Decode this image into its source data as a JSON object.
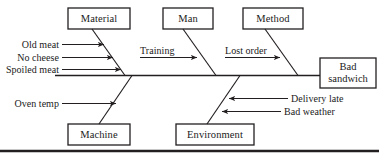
{
  "diagram": {
    "type": "fishbone-ishikawa",
    "effect": {
      "label_line1": "Bad",
      "label_line2": "sandwich"
    },
    "categories": [
      {
        "id": "material",
        "label": "Material",
        "position": "top",
        "causes": [
          {
            "label": "Old meat",
            "arrow": "right"
          },
          {
            "label": "No cheese",
            "arrow": "right"
          },
          {
            "label": "Spoiled meat",
            "arrow": "right"
          }
        ]
      },
      {
        "id": "man",
        "label": "Man",
        "position": "top",
        "causes": [
          {
            "label": "Training",
            "arrow": "right"
          }
        ]
      },
      {
        "id": "method",
        "label": "Method",
        "position": "top",
        "causes": [
          {
            "label": "Lost order",
            "arrow": "right"
          }
        ]
      },
      {
        "id": "machine",
        "label": "Machine",
        "position": "bottom",
        "causes": [
          {
            "label": "Oven temp",
            "arrow": "right"
          }
        ]
      },
      {
        "id": "environment",
        "label": "Environment",
        "position": "bottom",
        "causes": [
          {
            "label": "Delivery late",
            "arrow": "left"
          },
          {
            "label": "Bad weather",
            "arrow": "left"
          }
        ]
      }
    ],
    "colors": {
      "stroke": "#231f20",
      "background": "#ffffff",
      "text": "#1a1a1a"
    }
  }
}
